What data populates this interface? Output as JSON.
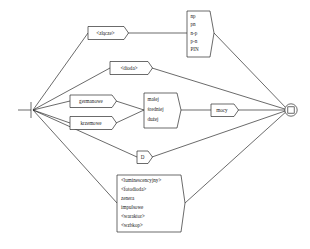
{
  "diagram": {
    "type": "railroad-syntax-diagram",
    "language": "pl",
    "stroke_color": "#2b2b2b",
    "background_color": "#ffffff",
    "start_node": {
      "name": "entry-fan-node",
      "label": ""
    },
    "end_node": {
      "name": "terminal-node",
      "label": ""
    },
    "nodes": {
      "zlacze": {
        "label": "<złącze>"
      },
      "dioda": {
        "label": "<dioda>"
      },
      "germanowe": {
        "label": "germanowe"
      },
      "krzemowe": {
        "label": "krzemowe"
      },
      "mocy": {
        "label": "mocy"
      },
      "d_letter": {
        "label": "D"
      },
      "junction_types": {
        "lines": [
          "np",
          "pn",
          "n-p",
          "p-n",
          "PIN"
        ]
      },
      "power_levels": {
        "lines": [
          "małej",
          "średniej",
          "dużej"
        ]
      },
      "diode_kinds": {
        "lines": [
          "<luminescencyjny>",
          "<fotodioda>",
          "zenera",
          "impulsowe",
          "<waraktor>",
          "<wzbkop>"
        ]
      }
    }
  }
}
